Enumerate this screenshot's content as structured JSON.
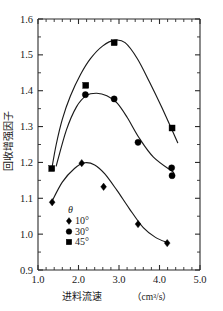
{
  "chart_data": {
    "type": "line",
    "title": "",
    "xlabel": "进料流速（cm³/s）",
    "xlabel_main": "进料流速",
    "xlabel_unit": "（cm³/s）",
    "ylabel": "回收增强因子",
    "xlim": [
      1.0,
      5.0
    ],
    "ylim": [
      0.9,
      1.6
    ],
    "xticks": [
      1.0,
      2.0,
      3.0,
      4.0,
      5.0
    ],
    "xtick_labels": [
      "1.0",
      "2.0",
      "3.0",
      "4.0",
      "5.0"
    ],
    "yticks": [
      0.9,
      1.0,
      1.1,
      1.2,
      1.3,
      1.4,
      1.5,
      1.6
    ],
    "ytick_labels": [
      "0.9",
      "1.0",
      "1.1",
      "1.2",
      "1.3",
      "1.4",
      "1.5",
      "1.6"
    ],
    "x_minor_step": 0.2,
    "y_minor_step": 0.05,
    "grid": false,
    "legend_position": "lower-left-inside",
    "legend_title": "θ",
    "series": [
      {
        "name": "10°",
        "marker": "diamond",
        "points": [
          {
            "x": 1.35,
            "y": 1.089
          },
          {
            "x": 2.08,
            "y": 1.198
          },
          {
            "x": 2.62,
            "y": 1.132
          },
          {
            "x": 3.47,
            "y": 1.028
          },
          {
            "x": 4.19,
            "y": 0.975
          }
        ]
      },
      {
        "name": "30°",
        "marker": "circle",
        "points": [
          {
            "x": 2.17,
            "y": 1.389
          },
          {
            "x": 2.88,
            "y": 1.377
          },
          {
            "x": 3.47,
            "y": 1.256
          },
          {
            "x": 4.3,
            "y": 1.185
          },
          {
            "x": 4.31,
            "y": 1.163
          }
        ]
      },
      {
        "name": "45°",
        "marker": "square",
        "points": [
          {
            "x": 1.34,
            "y": 1.183
          },
          {
            "x": 2.18,
            "y": 1.415
          },
          {
            "x": 2.88,
            "y": 1.534
          },
          {
            "x": 4.31,
            "y": 1.296
          }
        ]
      }
    ]
  },
  "legend": {
    "title": "θ",
    "items": [
      {
        "marker": "diamond",
        "label": "10°"
      },
      {
        "marker": "circle",
        "label": "30°"
      },
      {
        "marker": "square",
        "label": "45°"
      }
    ]
  },
  "colors": {
    "axis": "#2b2b2b",
    "curve": "#1a1a1a",
    "marker": "#000000",
    "background": "#ffffff",
    "text": "#1a1a1a"
  }
}
